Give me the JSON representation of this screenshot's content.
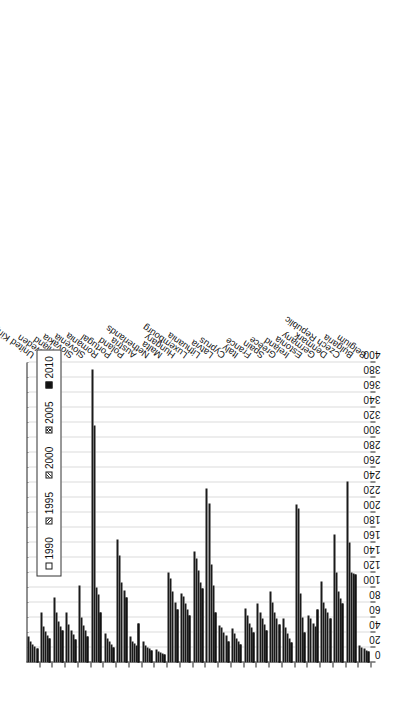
{
  "caption": "",
  "legend": {
    "position": "inside-top-left",
    "items": [
      {
        "label": "1990",
        "pattern": "empty"
      },
      {
        "label": "1995",
        "pattern": "hatch-forward"
      },
      {
        "label": "2000",
        "pattern": "hatch-back"
      },
      {
        "label": "2005",
        "pattern": "crosshatch"
      },
      {
        "label": "2010",
        "pattern": "solid-black"
      }
    ]
  },
  "chart_data": {
    "type": "bar",
    "orientation": "rotated-90",
    "title": "",
    "xlabel": "",
    "ylabel": "",
    "ylim": [
      0,
      400
    ],
    "ytick_step": 20,
    "grid": true,
    "tick_labels": [
      "0",
      "20",
      "40",
      "60",
      "80",
      "100",
      "120",
      "140",
      "160",
      "180",
      "200",
      "220",
      "240",
      "260",
      "280",
      "300",
      "320",
      "340",
      "360",
      "380",
      "400"
    ],
    "categories": [
      "Belgium",
      "Bulgaria",
      "Czech Republic",
      "Denmark",
      "Germany",
      "Estonia",
      "Ireland",
      "Greece",
      "Spain",
      "France",
      "Italy",
      "Cyprus",
      "Latvia",
      "Lithuania",
      "Luxembourg",
      "Hungary",
      "Malta",
      "Netherlands",
      "Austria",
      "Poland",
      "Portugal",
      "Romania",
      "Slovenia",
      "Slovakia",
      "Finland",
      "Sweden",
      "United Kingdom"
    ],
    "series": [
      {
        "name": "1990",
        "values": [
          23,
          241,
          170,
          108,
          62,
          211,
          59,
          95,
          78,
          72,
          45,
          49,
          232,
          148,
          92,
          120,
          17,
          28,
          34,
          164,
          38,
          391,
          103,
          67,
          86,
          66,
          34
        ]
      },
      {
        "name": "1995",
        "values": [
          20,
          160,
          120,
          80,
          58,
          205,
          47,
          80,
          66,
          62,
          38,
          46,
          212,
          138,
          88,
          112,
          15,
          22,
          28,
          142,
          32,
          316,
          60,
          50,
          66,
          48,
          28
        ]
      },
      {
        "name": "2000",
        "values": [
          18,
          120,
          95,
          72,
          52,
          92,
          38,
          66,
          58,
          52,
          32,
          40,
          130,
          122,
          78,
          95,
          13,
          20,
          25,
          106,
          28,
          100,
          49,
          42,
          55,
          41,
          24
        ]
      },
      {
        "name": "2005",
        "values": [
          16,
          118,
          85,
          66,
          48,
          60,
          32,
          58,
          50,
          46,
          28,
          36,
          102,
          106,
          70,
          80,
          12,
          18,
          22,
          96,
          24,
          90,
          42,
          37,
          48,
          36,
          21
        ]
      },
      {
        "name": "2010",
        "values": [
          14,
          117,
          78,
          58,
          70,
          40,
          27,
          50,
          42,
          40,
          24,
          28,
          66,
          98,
          62,
          70,
          10,
          16,
          52,
          86,
          20,
          66,
          35,
          31,
          42,
          32,
          18
        ]
      }
    ]
  }
}
